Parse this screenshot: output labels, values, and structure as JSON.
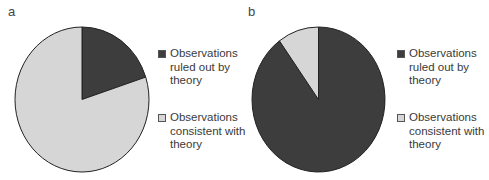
{
  "colors": {
    "ruled_out": "#3d3d3d",
    "consistent": "#d6d6d6",
    "outline": "#222222"
  },
  "legend": {
    "ruled_out": "Observations ruled out by theory",
    "consistent": "Observations consistent with theory"
  },
  "panels": [
    {
      "label": "a",
      "ruled_out_pct": 20,
      "consistent_pct": 80
    },
    {
      "label": "b",
      "ruled_out_pct": 90,
      "consistent_pct": 10
    }
  ],
  "chart_data": [
    {
      "type": "pie",
      "title": "a",
      "labels": [
        "Observations ruled out by theory",
        "Observations consistent with theory"
      ],
      "values": [
        20,
        80
      ],
      "colors": [
        "#3d3d3d",
        "#d6d6d6"
      ],
      "legend_position": "right",
      "start_angle": "12 o'clock, clockwise"
    },
    {
      "type": "pie",
      "title": "b",
      "labels": [
        "Observations ruled out by theory",
        "Observations consistent with theory"
      ],
      "values": [
        90,
        10
      ],
      "colors": [
        "#3d3d3d",
        "#d6d6d6"
      ],
      "legend_position": "right",
      "start_angle": "12 o'clock, clockwise"
    }
  ]
}
